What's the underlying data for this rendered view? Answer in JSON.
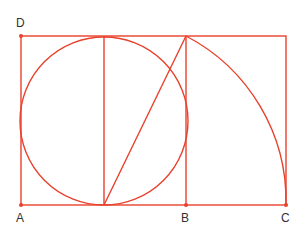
{
  "diagram": {
    "type": "golden-rectangle-construction",
    "stroke_color": "#e8412c",
    "label_color": "#333333",
    "points": {
      "A": {
        "label": "A",
        "x": 21,
        "y": 205
      },
      "B": {
        "label": "B",
        "x": 186,
        "y": 205
      },
      "C": {
        "label": "C",
        "x": 286,
        "y": 205
      },
      "D": {
        "label": "D",
        "x": 21,
        "y": 36
      }
    }
  }
}
